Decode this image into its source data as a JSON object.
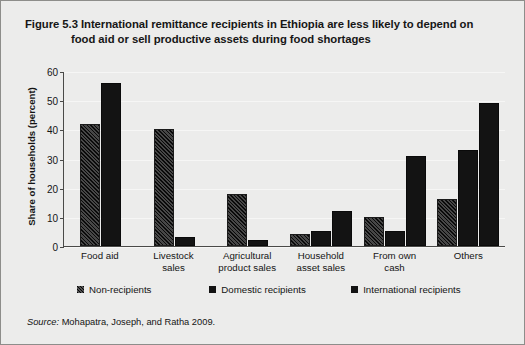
{
  "figure": {
    "title_line1": "Figure 5.3  International remittance recipients in Ethiopia are less likely to depend on",
    "title_line2": "food aid or sell productive assets during food shortages",
    "source_label": "Source:",
    "source_text": " Mohapatra, Joseph, and Ratha 2009."
  },
  "chart_data": {
    "type": "bar",
    "title": "Figure 5.3  International remittance recipients in Ethiopia are less likely to depend on food aid or sell productive assets during food shortages",
    "xlabel": "",
    "ylabel": "Share of households (percent)",
    "ylim": [
      0,
      60
    ],
    "yticks": [
      0,
      10,
      20,
      30,
      40,
      50,
      60
    ],
    "ytick_labels": [
      "0",
      "10",
      "20",
      "30",
      "40",
      "50",
      "60"
    ],
    "grid": true,
    "legend_position": "below",
    "categories": [
      "Food aid",
      "Livestock sales",
      "Agricultural product sales",
      "Household asset sales",
      "From own cash",
      "Others"
    ],
    "category_lines": [
      [
        "Food aid"
      ],
      [
        "Livestock",
        "sales"
      ],
      [
        "Agricultural",
        "product sales"
      ],
      [
        "Household",
        "asset sales"
      ],
      [
        "From own",
        "cash"
      ],
      [
        "Others"
      ]
    ],
    "series": [
      {
        "name": "Non-recipients",
        "values": [
          42,
          40,
          18,
          4,
          10,
          16
        ]
      },
      {
        "name": "Domestic recipients",
        "values": [
          0,
          3,
          2,
          5,
          5,
          33
        ]
      },
      {
        "name": "International recipients",
        "values": [
          56,
          0,
          0,
          12,
          31,
          49
        ]
      }
    ],
    "colors": {
      "non_recipients": "#2a2a2a",
      "domestic_recipients": "#131313",
      "international_recipients": "#131313",
      "background": "#ececeb",
      "axis": "#4a4a48"
    }
  }
}
